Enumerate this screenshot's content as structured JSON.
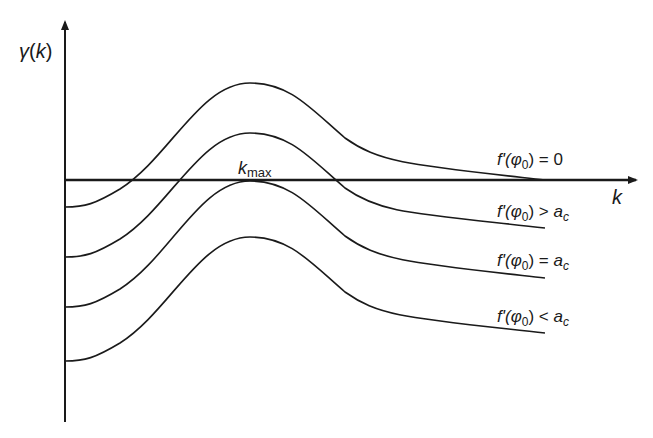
{
  "axes": {
    "y_label": {
      "symbol": "γ",
      "arg": "k"
    },
    "x_label": "k",
    "peak_label": {
      "base": "k",
      "sub": "max"
    }
  },
  "curves": [
    {
      "id": "curve-zero",
      "label": {
        "pre": "f'(",
        "phi": "φ",
        "sub": "0",
        "post": ") = 0",
        "ac": ""
      }
    },
    {
      "id": "curve-greater",
      "label": {
        "pre": "f'(",
        "phi": "φ",
        "sub": "0",
        "post": ") > ",
        "ac": "a",
        "ac_sub": "c"
      }
    },
    {
      "id": "curve-equal",
      "label": {
        "pre": "f'(",
        "phi": "φ",
        "sub": "0",
        "post": ") = ",
        "ac": "a",
        "ac_sub": "c"
      }
    },
    {
      "id": "curve-less",
      "label": {
        "pre": "f'(",
        "phi": "φ",
        "sub": "0",
        "post": ") < ",
        "ac": "a",
        "ac_sub": "c"
      }
    }
  ],
  "colors": {
    "ink": "#1a1a1a",
    "background": "#ffffff"
  }
}
